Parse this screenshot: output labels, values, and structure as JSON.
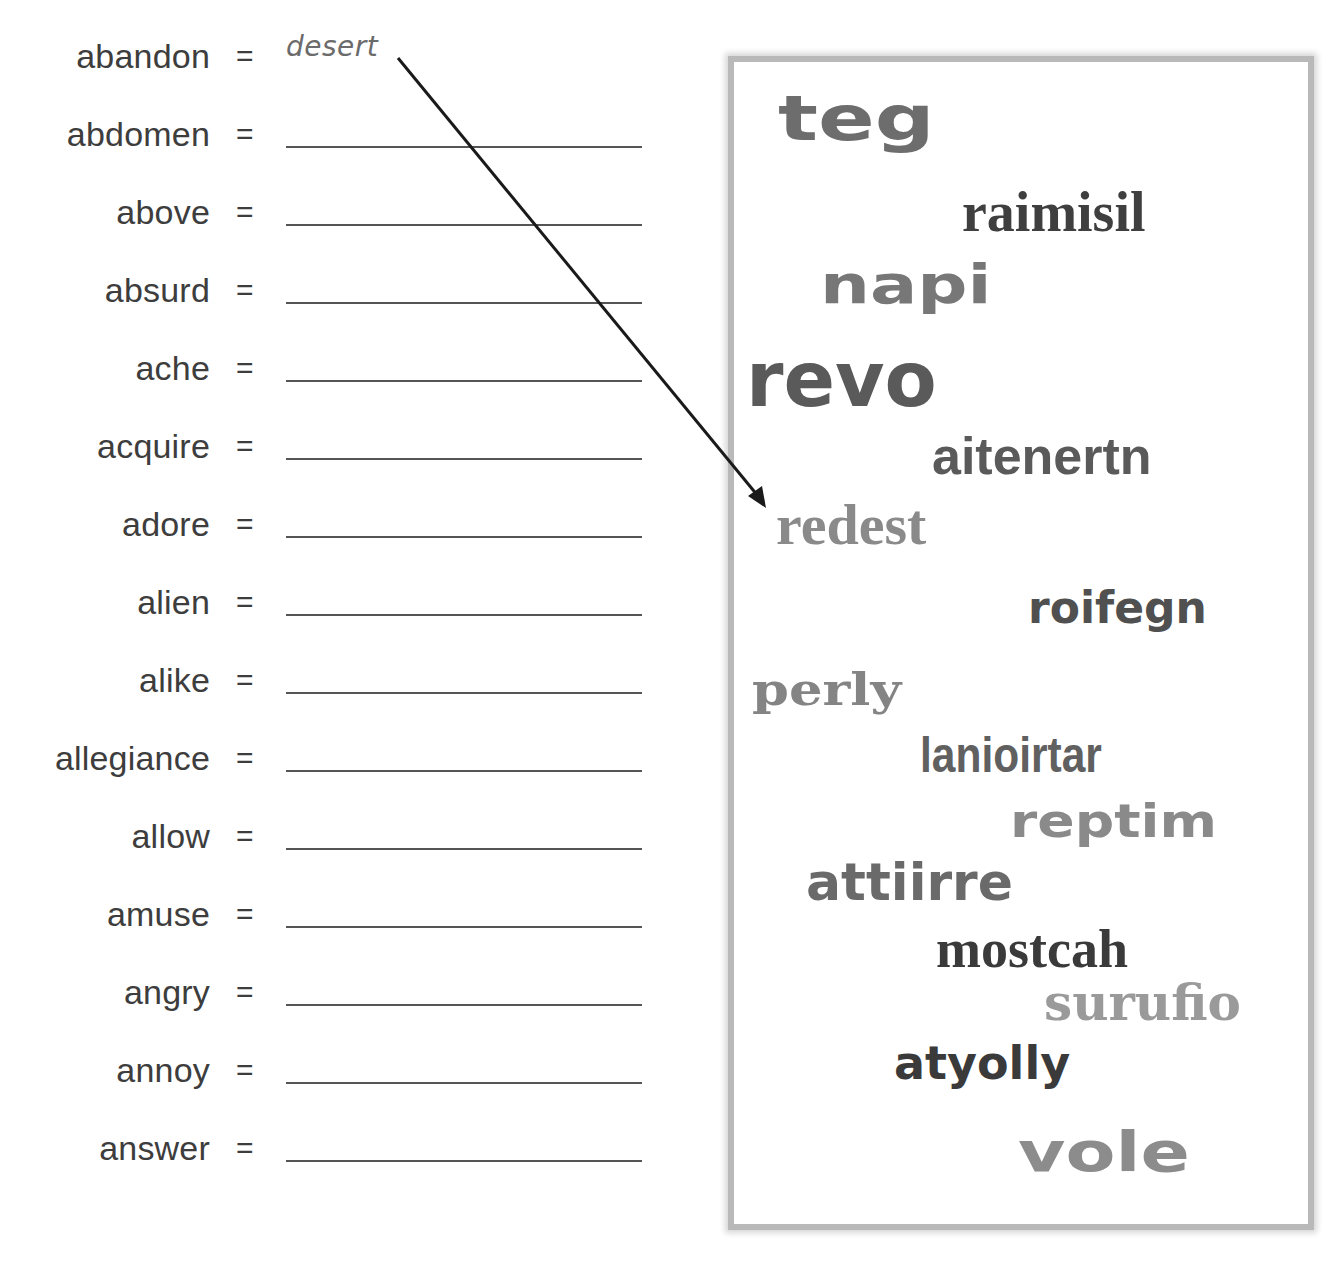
{
  "worksheet": {
    "rows": [
      {
        "word": "abandon",
        "equals": "=",
        "answer": "desert"
      },
      {
        "word": "abdomen",
        "equals": "=",
        "answer": ""
      },
      {
        "word": "above",
        "equals": "=",
        "answer": ""
      },
      {
        "word": "absurd",
        "equals": "=",
        "answer": ""
      },
      {
        "word": "ache",
        "equals": "=",
        "answer": ""
      },
      {
        "word": "acquire",
        "equals": "=",
        "answer": ""
      },
      {
        "word": "adore",
        "equals": "=",
        "answer": ""
      },
      {
        "word": "alien",
        "equals": "=",
        "answer": ""
      },
      {
        "word": "alike",
        "equals": "=",
        "answer": ""
      },
      {
        "word": "allegiance",
        "equals": "=",
        "answer": ""
      },
      {
        "word": "allow",
        "equals": "=",
        "answer": ""
      },
      {
        "word": "amuse",
        "equals": "=",
        "answer": ""
      },
      {
        "word": "angry",
        "equals": "=",
        "answer": ""
      },
      {
        "word": "annoy",
        "equals": "=",
        "answer": ""
      },
      {
        "word": "answer",
        "equals": "=",
        "answer": ""
      }
    ]
  },
  "word_box": {
    "jumbles": [
      "teg",
      "raimisil",
      "napi",
      "revo",
      "aitenertn",
      "redest",
      "roifegn",
      "perly",
      "lanioirtar",
      "reptim",
      "attiirre",
      "mostcah",
      "surufio",
      "atyolly",
      "vole"
    ]
  },
  "arrow": {
    "from": "desert",
    "to": "redest"
  }
}
